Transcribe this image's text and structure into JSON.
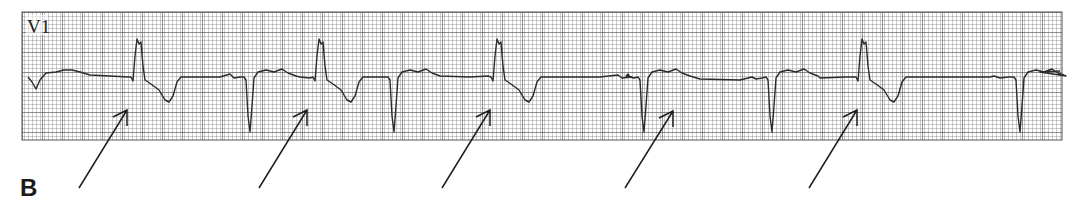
{
  "figure": {
    "panel_label": "B",
    "lead_label": "V1",
    "colors": {
      "paper": "#ffffff",
      "grid_minor": "#8a8a8a",
      "grid_major": "#555555",
      "trace": "#2a2a2a",
      "arrow": "#1e1e1e"
    }
  },
  "strip": {
    "beats": [
      {
        "type": "wide-positive",
        "label": "wide complex"
      },
      {
        "type": "narrow-negative",
        "label": "narrow complex"
      },
      {
        "type": "wide-positive",
        "label": "wide complex"
      },
      {
        "type": "narrow-negative",
        "label": "narrow complex"
      },
      {
        "type": "wide-positive",
        "label": "wide complex"
      },
      {
        "type": "narrow-negative",
        "label": "narrow complex"
      },
      {
        "type": "narrow-negative",
        "label": "narrow complex"
      },
      {
        "type": "wide-positive",
        "label": "wide complex"
      },
      {
        "type": "narrow-negative",
        "label": "narrow complex"
      }
    ],
    "arrow_count": 5
  }
}
